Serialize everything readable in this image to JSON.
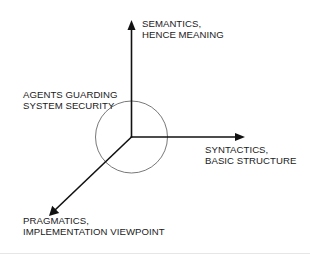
{
  "diagram": {
    "type": "3d-axes",
    "colors": {
      "axis": "#111111",
      "circle": "#555555",
      "text": "#1a1a1a",
      "background": "#ffffff"
    },
    "axes": {
      "vertical": {
        "line1": "SEMANTICS,",
        "line2": "HENCE MEANING"
      },
      "horizontal": {
        "line1": "SYNTACTICS,",
        "line2": "BASIC STRUCTURE"
      },
      "diagonal": {
        "line1": "PRAGMATICS,",
        "line2": "IMPLEMENTATION VIEWPOINT"
      }
    },
    "center": {
      "line1": "AGENTS GUARDING",
      "line2": "SYSTEM SECURITY"
    }
  }
}
